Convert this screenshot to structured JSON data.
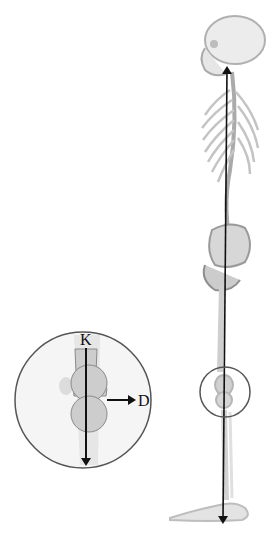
{
  "figure": {
    "main_arrow": {
      "direction": "bidirectional-vertical",
      "description": "Line from head to foot"
    },
    "knee_marker": {
      "shape": "circle",
      "description": "Knee region highlighted"
    },
    "inset": {
      "shape": "circle",
      "description": "Magnified knee joint",
      "labels": {
        "vertical_axis": "K",
        "horizontal_arrow": "D"
      }
    }
  },
  "colors": {
    "line": "#111111",
    "bone": "#c8c8c8",
    "bone_dark": "#9a9a9a",
    "joint_fill": "#cfcfcf",
    "circle_stroke": "#555555",
    "inset_bg": "#f4f4f4"
  }
}
